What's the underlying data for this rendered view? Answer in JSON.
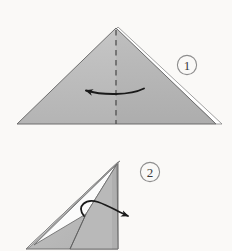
{
  "figure": {
    "kind": "origami-fold-instructions",
    "background_color": "#faf9f7",
    "paper_fill": "#bcbcbc",
    "paper_fill_shade": "#adadad",
    "paper_edge_color": "#6b6b6b",
    "crease_color": "#555555",
    "arrow_color": "#1a1a1a",
    "badge_stroke_color": "#8a8a8a",
    "badge_text_color": "#3a3a3a"
  },
  "steps": [
    {
      "number": "1",
      "badge_label": "1",
      "badge": {
        "cx": 187,
        "cy": 65,
        "r": 9.5
      },
      "shape": {
        "name": "folded-triangle",
        "apex": [
          116,
          28
        ],
        "left_corner": [
          17,
          124
        ],
        "right_corner": [
          216,
          124
        ]
      },
      "crease": {
        "name": "vertical-valley-crease",
        "style": "dashed",
        "x": 116,
        "y_top": 30,
        "y_bottom": 124
      },
      "arrow": {
        "name": "fold-left-arrow",
        "direction": "left",
        "tail": [
          144,
          89
        ],
        "head": [
          83,
          89
        ]
      }
    },
    {
      "number": "2",
      "badge_label": "2",
      "badge": {
        "cx": 150,
        "cy": 172,
        "r": 9.5
      },
      "shape": {
        "name": "folded-right-triangle",
        "apex": [
          118,
          162
        ],
        "left_corner": [
          26,
          249
        ],
        "right_corner": [
          118,
          249
        ]
      },
      "arrow": {
        "name": "unfold-right-arrow",
        "direction": "right-down",
        "tail": [
          92,
          207
        ],
        "head": [
          133,
          217
        ]
      }
    }
  ]
}
